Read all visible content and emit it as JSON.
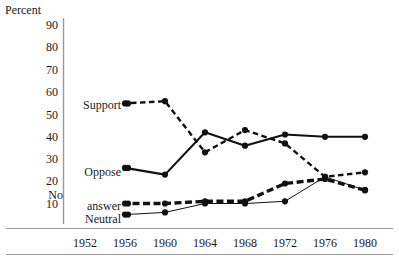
{
  "chart_data": {
    "type": "line",
    "title": "",
    "subtitle": "",
    "xlabel": "",
    "ylabel": "Percent",
    "ylim": [
      0,
      95
    ],
    "xlim": [
      1950,
      1982
    ],
    "grid": false,
    "legend_position": "inline-left",
    "yticks": [
      10,
      20,
      30,
      40,
      50,
      60,
      70,
      80,
      90
    ],
    "ytick_labels": [
      "10",
      "20",
      "30",
      "40",
      "50",
      "60",
      "70",
      "80",
      "90"
    ],
    "categories": [
      1952,
      1956,
      1960,
      1964,
      1968,
      1972,
      1976,
      1980
    ],
    "xtick_labels": [
      "1952",
      "1956",
      "1960",
      "1964",
      "1968",
      "1972",
      "1976",
      "1980"
    ],
    "series": [
      {
        "name": "Support",
        "style": "dashed-medium",
        "x": [
          1956,
          1960,
          1964,
          1968,
          1972,
          1976,
          1980
        ],
        "values": [
          55,
          56,
          33,
          43,
          37,
          22,
          24
        ]
      },
      {
        "name": "Oppose",
        "style": "solid-thick",
        "x": [
          1956,
          1960,
          1964,
          1968,
          1972,
          1976,
          1980
        ],
        "values": [
          26,
          23,
          42,
          36,
          41,
          40,
          40
        ]
      },
      {
        "name": "No answer",
        "style": "dashed-thick",
        "x": [
          1956,
          1960,
          1964,
          1968,
          1972,
          1976,
          1980
        ],
        "values": [
          10,
          10,
          11,
          11,
          19,
          21,
          16
        ]
      },
      {
        "name": "Neutral",
        "style": "solid-thin",
        "x": [
          1956,
          1960,
          1964,
          1968,
          1972,
          1976,
          1980
        ],
        "values": [
          5,
          6,
          10,
          10,
          11,
          22,
          16
        ]
      }
    ],
    "annotations": [
      {
        "text": "Support",
        "value": 55
      },
      {
        "text": "Oppose",
        "value": 26
      },
      {
        "text": "No answer",
        "value": 10
      },
      {
        "text": "Neutral",
        "value": 5
      }
    ]
  },
  "labels": {
    "axis_y_title": "Percent",
    "series_support": "Support",
    "series_oppose": "Oppose",
    "series_no_answer_line1": "No",
    "series_no_answer_line2": "answer",
    "series_neutral": "Neutral"
  }
}
